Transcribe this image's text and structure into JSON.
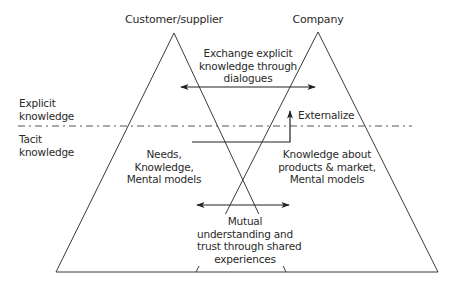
{
  "titles": {
    "left_party": "Customer/supplier",
    "right_party": "Company"
  },
  "levels": {
    "explicit": [
      "Explicit",
      "knowledge"
    ],
    "tacit": [
      "Tacit",
      "knowledge"
    ]
  },
  "annotations": {
    "exchange": [
      "Exchange explicit",
      "knowledge through",
      "dialogues"
    ],
    "externalize": "Externalize",
    "left_contents": [
      "Needs,",
      "Knowledge,",
      "Mental models"
    ],
    "right_contents": [
      "Knowledge about",
      "products & market,",
      "Mental models"
    ],
    "mutual": [
      "Mutual",
      "understanding and",
      "trust through shared",
      "experiences"
    ]
  },
  "colors": {
    "line": "#3a3a3a",
    "dashed": "#555555",
    "text": "#2a2a2a"
  }
}
